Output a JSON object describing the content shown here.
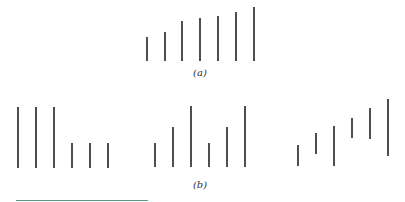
{
  "figure": {
    "line_color": "#222222",
    "line_width": 1.6,
    "panel_a": {
      "label": "(a)",
      "label_pos": {
        "x": 200,
        "y": 67
      },
      "lines": [
        {
          "x": 147,
          "y1": 37,
          "y2": 61
        },
        {
          "x": 165,
          "y1": 32,
          "y2": 61
        },
        {
          "x": 182,
          "y1": 21,
          "y2": 61
        },
        {
          "x": 200,
          "y1": 18,
          "y2": 61
        },
        {
          "x": 218,
          "y1": 16,
          "y2": 61
        },
        {
          "x": 236,
          "y1": 12,
          "y2": 61
        },
        {
          "x": 254,
          "y1": 7,
          "y2": 61
        }
      ]
    },
    "panel_b": {
      "label": "(b)",
      "label_pos": {
        "x": 200,
        "y": 179
      },
      "groups": [
        {
          "name": "group-1",
          "lines": [
            {
              "x": 18,
              "y1": 107,
              "y2": 168
            },
            {
              "x": 36,
              "y1": 107,
              "y2": 168
            },
            {
              "x": 54,
              "y1": 107,
              "y2": 168
            },
            {
              "x": 72,
              "y1": 143,
              "y2": 168
            },
            {
              "x": 90,
              "y1": 143,
              "y2": 168
            },
            {
              "x": 108,
              "y1": 143,
              "y2": 168
            }
          ]
        },
        {
          "name": "group-2",
          "lines": [
            {
              "x": 155,
              "y1": 143,
              "y2": 167
            },
            {
              "x": 173,
              "y1": 127,
              "y2": 167
            },
            {
              "x": 191,
              "y1": 106,
              "y2": 167
            },
            {
              "x": 209,
              "y1": 143,
              "y2": 167
            },
            {
              "x": 227,
              "y1": 127,
              "y2": 167
            },
            {
              "x": 245,
              "y1": 106,
              "y2": 167
            }
          ]
        },
        {
          "name": "group-3",
          "lines": [
            {
              "x": 298,
              "y1": 145,
              "y2": 166
            },
            {
              "x": 316,
              "y1": 133,
              "y2": 154
            },
            {
              "x": 334,
              "y1": 126,
              "y2": 166
            },
            {
              "x": 352,
              "y1": 118,
              "y2": 138
            },
            {
              "x": 370,
              "y1": 108,
              "y2": 139
            },
            {
              "x": 388,
              "y1": 99,
              "y2": 156
            }
          ]
        }
      ]
    },
    "footer_rule": {
      "x1": 16,
      "x2": 148,
      "y": 200,
      "color": "#5a9a86"
    }
  }
}
